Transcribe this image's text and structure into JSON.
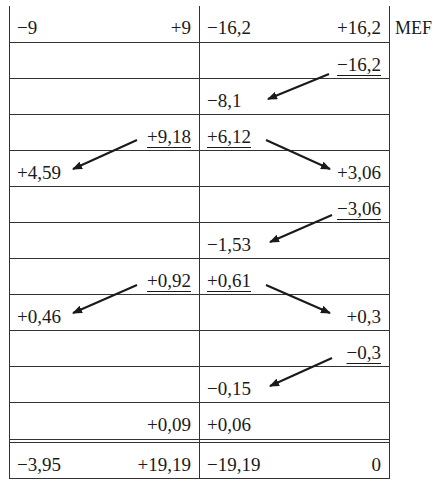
{
  "table": {
    "side_label": "MEF",
    "rows": [
      {
        "a_left": "−9",
        "a_right": "+9",
        "b_left": "−16,2",
        "b_right": "+16,2"
      },
      {
        "a_left": "",
        "a_right": "",
        "b_left": "",
        "b_right": "−16,2"
      },
      {
        "a_left": "",
        "a_right": "",
        "b_left": "−8,1",
        "b_right": ""
      },
      {
        "a_left": "",
        "a_right": "+9,18",
        "b_left": "+6,12",
        "b_right": ""
      },
      {
        "a_left": "+4,59",
        "a_right": "",
        "b_left": "",
        "b_right": "+3,06"
      },
      {
        "a_left": "",
        "a_right": "",
        "b_left": "",
        "b_right": "−3,06"
      },
      {
        "a_left": "",
        "a_right": "",
        "b_left": "−1,53",
        "b_right": ""
      },
      {
        "a_left": "",
        "a_right": "+0,92",
        "b_left": "+0,61",
        "b_right": ""
      },
      {
        "a_left": "+0,46",
        "a_right": "",
        "b_left": "",
        "b_right": "+0,3"
      },
      {
        "a_left": "",
        "a_right": "",
        "b_left": "",
        "b_right": "−0,3"
      },
      {
        "a_left": "",
        "a_right": "",
        "b_left": "−0,15",
        "b_right": ""
      },
      {
        "a_left": "",
        "a_right": "+0,09",
        "b_left": "+0,06",
        "b_right": ""
      },
      {
        "a_left": "−3,95",
        "a_right": "+19,19",
        "b_left": "−19,19",
        "b_right": "0"
      }
    ]
  },
  "colors": {
    "line": "#333333",
    "text": "#1a1a1a"
  }
}
